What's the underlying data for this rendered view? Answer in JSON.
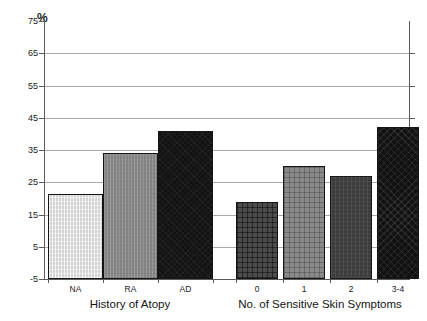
{
  "chart_data": {
    "type": "bar",
    "title": "",
    "subtitle": "",
    "xlabel": "",
    "ylabel": "%",
    "ylim": [
      -5,
      75
    ],
    "yticks": [
      75,
      65,
      55,
      45,
      35,
      25,
      15,
      5,
      -5
    ],
    "ytick_labels": [
      "75",
      "65",
      "55",
      "45",
      "35",
      "25",
      "15",
      "5",
      "-5"
    ],
    "grid": true,
    "gridlines_at": [
      65,
      55,
      45,
      35,
      25,
      15,
      5
    ],
    "legend": [],
    "legend_position": "none",
    "groups": [
      {
        "name": "History of Atopy",
        "axis_title": "History of Atopy",
        "categories": [
          "NA",
          "RA",
          "AD"
        ],
        "values": [
          21.5,
          34.0,
          41.0
        ],
        "fills": [
          "light-vertical-hatch",
          "mid-gray",
          "black"
        ]
      },
      {
        "name": "No. of Sensitive Skin Symptoms",
        "axis_title": "No. of Sensitive Skin Symptoms",
        "categories": [
          "0",
          "1",
          "2",
          "3-4"
        ],
        "values": [
          19.0,
          30.0,
          27.0,
          42.0
        ],
        "fills": [
          "dark-crosshatch",
          "gray-crosshatch",
          "dark-gray",
          "black-crosshatch"
        ]
      }
    ],
    "categories": [
      "NA",
      "RA",
      "AD",
      "0",
      "1",
      "2",
      "3-4"
    ],
    "values": [
      21.5,
      34.0,
      41.0,
      19.0,
      30.0,
      27.0,
      42.0
    ],
    "colors": {
      "axis": "#5a5a5a",
      "grid": "#a9a9a9",
      "bar_outline": "#151515",
      "background": "#ffffff",
      "text": "#1a1a1a"
    }
  },
  "axis": {
    "unit_label": "%"
  }
}
